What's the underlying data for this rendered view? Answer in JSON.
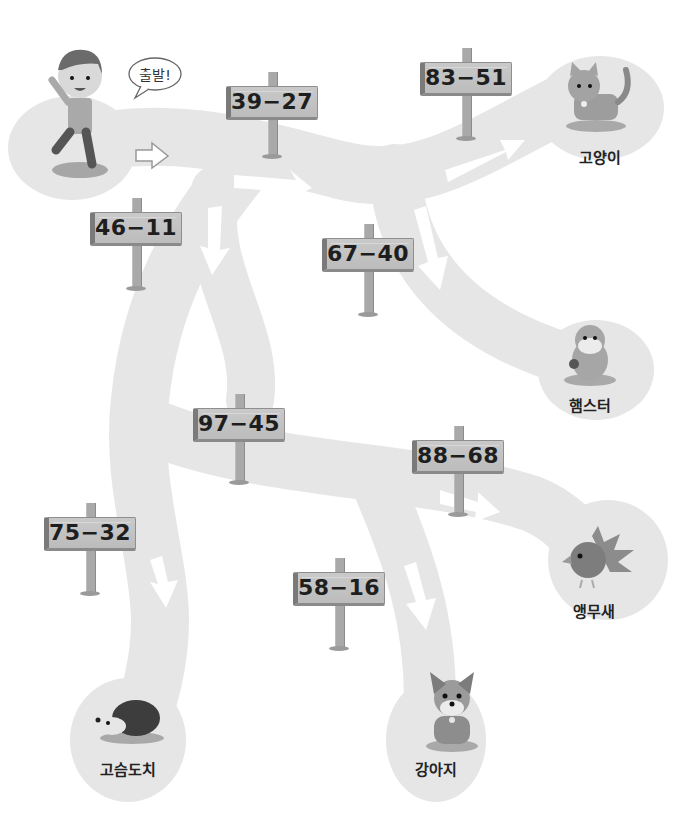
{
  "header": {
    "instruction_partial": "(cut off at top edge)"
  },
  "start": {
    "character": "boy",
    "speech_bubble": "출발!"
  },
  "signs": [
    {
      "id": "s1",
      "expression": "39−27",
      "x": 226,
      "y": 86
    },
    {
      "id": "s2",
      "expression": "83−51",
      "x": 420,
      "y": 62
    },
    {
      "id": "s3",
      "expression": "46−11",
      "x": 90,
      "y": 212
    },
    {
      "id": "s4",
      "expression": "67−40",
      "x": 322,
      "y": 238
    },
    {
      "id": "s5",
      "expression": "97−45",
      "x": 193,
      "y": 408
    },
    {
      "id": "s6",
      "expression": "88−68",
      "x": 412,
      "y": 440
    },
    {
      "id": "s7",
      "expression": "75−32",
      "x": 44,
      "y": 517
    },
    {
      "id": "s8",
      "expression": "58−16",
      "x": 293,
      "y": 572
    }
  ],
  "destinations": [
    {
      "id": "cat",
      "label": "고양이",
      "x": 560,
      "y": 146
    },
    {
      "id": "hamster",
      "label": "햄스터",
      "x": 552,
      "y": 394
    },
    {
      "id": "parrot",
      "label": "앵무새",
      "x": 556,
      "y": 600
    },
    {
      "id": "hedgehog",
      "label": "고슴도치",
      "x": 97,
      "y": 758
    },
    {
      "id": "puppy",
      "label": "강아지",
      "x": 404,
      "y": 758
    }
  ],
  "colors": {
    "path": "#e6e6e6",
    "sign_board": "#c4c4c4",
    "sign_edge": "#7a7a7a",
    "text": "#1e1e1e",
    "arrow": "#ffffff"
  }
}
